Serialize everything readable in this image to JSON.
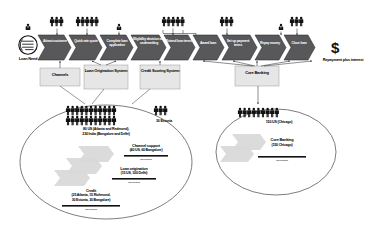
{
  "diagram": {
    "colors": {
      "chevron_fill": "#58585a",
      "chevron_stroke": "#2b2b2d",
      "system_box_fill": "#e6e6e6",
      "system_box_stroke": "#9b9b9b",
      "ellipse_stroke": "#6e6e6e",
      "ribbon_fill": "#d9d9d9",
      "background": "#ffffff",
      "text_dark": "#000000",
      "text_light": "#ffffff"
    },
    "start": {
      "icon": "document-lines-icon",
      "person_icon": "single-person-icon",
      "label": "Loan Need"
    },
    "end": {
      "currency_symbol": "$",
      "label": "Repayment plus interest"
    },
    "steps": [
      {
        "label": "Attract customer",
        "people_icon": "people-group-icon",
        "people_count": 3,
        "actor": "group"
      },
      {
        "label": "Quick rate quote",
        "people_icon": "people-group-icon",
        "people_count": 5,
        "actor": "group"
      },
      {
        "label": "Complete loan application",
        "people_icon": "single-person-icon",
        "people_count": 1,
        "actor": "single"
      },
      {
        "label": "Eligibility decision and underwriting",
        "people_icon": "people-group-icon",
        "people_count": 5,
        "actor": "group"
      },
      {
        "label": "Extend loan terms",
        "people_icon": "none",
        "people_count": 0,
        "actor": "none"
      },
      {
        "label": "Award loan",
        "people_icon": "people-group-icon",
        "people_count": 3,
        "actor": "group"
      },
      {
        "label": "Set up payment terms",
        "people_icon": "none",
        "people_count": 0,
        "actor": "none"
      },
      {
        "label": "Repay money",
        "people_icon": "single-person-icon",
        "people_count": 1,
        "actor": "single"
      },
      {
        "label": "Close loan",
        "people_icon": "people-group-icon",
        "people_count": 3,
        "actor": "group"
      }
    ],
    "systems": [
      {
        "name": "channels-system",
        "label": "Channels"
      },
      {
        "name": "loan-origination-system",
        "label": "Loan Origination System"
      },
      {
        "name": "credit-scoring-system",
        "label": "Credit Scoring System"
      },
      {
        "name": "core-banking-system",
        "label": "Core Banking"
      }
    ],
    "left_cluster": {
      "headcount_icon": "people-group-icon",
      "headcount_rows": [
        11,
        11
      ],
      "headcount_summary_line1": "80 US (Atlanta and Redmond),",
      "headcount_summary_line2": "230 India (Bangalore and Delhi)",
      "side_group": {
        "icon": "people-group-icon",
        "count": 3,
        "label": "30 Estonia"
      },
      "ribbons": [
        {
          "title": "Channel support",
          "detail": "(40 US, 60 Bangalore)",
          "bar_caption": "value stream bar"
        },
        {
          "title": "Loan origination",
          "detail": "(15 US, 100 Delhi)",
          "bar_caption": "value stream bar"
        },
        {
          "title": "Credit",
          "detail_line1": "(25 Atlanta, 15 Richmond,",
          "detail_line2": "30 Estonia, 30 Bangalore)",
          "bar_caption": "value stream bar"
        }
      ]
    },
    "right_cluster": {
      "headcount_icon": "people-group-icon",
      "headcount_rows": [
        9
      ],
      "headcount_summary": "150 US (Chicago)",
      "ribbons": [
        {
          "title": "Core Banking",
          "detail": "(150 Chicago)",
          "bar_caption": "value stream bar"
        }
      ]
    }
  }
}
